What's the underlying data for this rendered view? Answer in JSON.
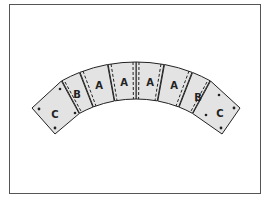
{
  "diagram": {
    "title": "",
    "pieces": [
      {
        "label": "C",
        "side": "left"
      },
      {
        "label": "B",
        "side": "left"
      },
      {
        "label": "A",
        "side": "left"
      },
      {
        "label": "A",
        "side": "left"
      },
      {
        "label": "A",
        "side": "right"
      },
      {
        "label": "A",
        "side": "right"
      },
      {
        "label": "B",
        "side": "right"
      },
      {
        "label": "C",
        "side": "right"
      }
    ],
    "colors": {
      "piece_fill": "#e3e3e3",
      "outline": "#222222",
      "frame": "#555555"
    }
  }
}
